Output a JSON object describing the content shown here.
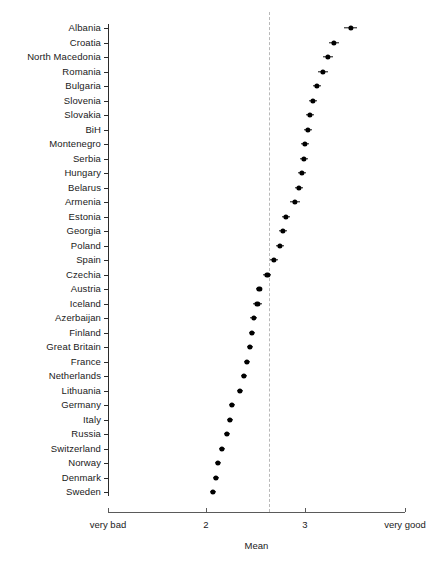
{
  "chart": {
    "type": "dot-plot-with-error-bars",
    "xlabel": "Mean",
    "ylabel": "",
    "title": "",
    "grid": false,
    "legend": "none",
    "reference_line_value": 2.64,
    "xlim": [
      1.73,
      4.7
    ],
    "xticks": [
      {
        "value": 1.73,
        "label": "very bad"
      },
      {
        "value": 2.0,
        "label": "2"
      },
      {
        "value": 3.0,
        "label": "3"
      },
      {
        "value": 4.7,
        "label": "very good"
      }
    ]
  },
  "chart_data": {
    "type": "scatter",
    "title": "",
    "xlabel": "Mean",
    "ylabel": "",
    "xlim": [
      1.73,
      4.7
    ],
    "grid": false,
    "legend": "none",
    "annotations": [
      {
        "kind": "vertical-dashed-reference-line",
        "x": 2.64
      }
    ],
    "categories": [
      "Albania",
      "Croatia",
      "North Macedonia",
      "Romania",
      "Bulgaria",
      "Slovenia",
      "Slovakia",
      "BiH",
      "Montenegro",
      "Serbia",
      "Hungary",
      "Belarus",
      "Armenia",
      "Estonia",
      "Georgia",
      "Poland",
      "Spain",
      "Czechia",
      "Austria",
      "Iceland",
      "Azerbaijan",
      "Finland",
      "Great Britain",
      "France",
      "Netherlands",
      "Lithuania",
      "Germany",
      "Italy",
      "Russia",
      "Switzerland",
      "Norway",
      "Denmark",
      "Sweden"
    ],
    "values": [
      3.46,
      3.29,
      3.23,
      3.18,
      3.12,
      3.08,
      3.05,
      3.03,
      3.0,
      2.99,
      2.97,
      2.94,
      2.9,
      2.81,
      2.78,
      2.75,
      2.69,
      2.62,
      2.54,
      2.52,
      2.48,
      2.46,
      2.44,
      2.41,
      2.38,
      2.34,
      2.26,
      2.24,
      2.21,
      2.16,
      2.12,
      2.1,
      2.07
    ],
    "errors_low": [
      3.39,
      3.24,
      3.18,
      3.13,
      3.08,
      3.04,
      3.01,
      2.99,
      2.96,
      2.95,
      2.93,
      2.9,
      2.85,
      2.77,
      2.74,
      2.71,
      2.65,
      2.58,
      2.51,
      2.47,
      2.44,
      2.43,
      2.41,
      2.38,
      2.35,
      2.31,
      2.23,
      2.21,
      2.18,
      2.13,
      2.09,
      2.07,
      2.04
    ],
    "errors_high": [
      3.53,
      3.34,
      3.28,
      3.23,
      3.16,
      3.12,
      3.09,
      3.07,
      3.04,
      3.03,
      3.01,
      2.98,
      2.95,
      2.85,
      2.82,
      2.79,
      2.73,
      2.66,
      2.57,
      2.57,
      2.52,
      2.49,
      2.47,
      2.44,
      2.41,
      2.37,
      2.29,
      2.27,
      2.24,
      2.19,
      2.15,
      2.13,
      2.1
    ]
  }
}
